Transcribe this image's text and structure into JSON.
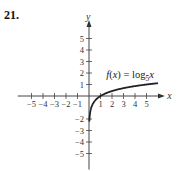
{
  "problem_number": "21.",
  "chart_data": {
    "type": "line",
    "title": "",
    "function_label": "f(x) = log5x",
    "function": {
      "name": "f",
      "expr": "log_5(x)",
      "base": 5
    },
    "xlabel": "x",
    "ylabel": "y",
    "xlim": [
      -6,
      6
    ],
    "ylim": [
      -6,
      6
    ],
    "x_ticks": [
      -5,
      -4,
      -3,
      -2,
      -1,
      1,
      2,
      3,
      4,
      5
    ],
    "y_ticks": [
      -5,
      -4,
      -3,
      -2,
      1,
      2,
      3,
      4,
      5
    ],
    "y_tick_labels_shown": [
      5,
      4,
      3,
      2,
      1,
      -2,
      -3,
      -4,
      -5
    ],
    "grid": false,
    "series": [
      {
        "name": "f(x) = log5 x",
        "x": [
          0.03,
          0.05,
          0.1,
          0.2,
          0.4,
          0.6,
          1,
          1.5,
          2,
          3,
          4,
          5,
          6
        ],
        "y": [
          -2.18,
          -1.86,
          -1.43,
          -1.0,
          -0.57,
          -0.32,
          0,
          0.25,
          0.43,
          0.68,
          0.86,
          1.0,
          1.11
        ]
      }
    ]
  },
  "labels": {
    "fn_prefix": "f(x) = log",
    "fn_base": "5",
    "fn_arg": "x",
    "x_axis": "x",
    "y_axis": "y"
  }
}
